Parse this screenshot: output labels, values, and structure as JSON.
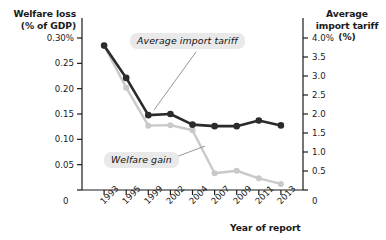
{
  "chart_data": {
    "type": "line",
    "title": "",
    "xlabel": "Year of report",
    "categories": [
      "1993",
      "1995",
      "1999",
      "2002",
      "2004",
      "2007",
      "2009",
      "2011",
      "2013"
    ],
    "grid": false,
    "legend_position": "inline-callouts",
    "axes": {
      "left": {
        "label": "Welfare loss (% of GDP)",
        "ticks": [
          "0",
          "0.05",
          "0.10",
          "0.15",
          "0.20",
          "0.25",
          "0.30%"
        ],
        "tick_values": [
          0,
          0.05,
          0.1,
          0.15,
          0.2,
          0.25,
          0.3
        ],
        "ylim": [
          0,
          0.3
        ]
      },
      "right": {
        "label": "Average import tariff (%)",
        "ticks": [
          "0",
          "0.5",
          "1.0",
          "1.5",
          "2.0",
          "2.5",
          "3.0",
          "3.5",
          "4.0%"
        ],
        "tick_values": [
          0,
          0.5,
          1.0,
          1.5,
          2.0,
          2.5,
          3.0,
          3.5,
          4.0
        ],
        "ylim": [
          0,
          4.0
        ]
      }
    },
    "series": [
      {
        "name": "Average import tariff",
        "axis": "right",
        "color": "#2b2b2b",
        "values": [
          3.8,
          2.95,
          1.97,
          2.0,
          1.72,
          1.68,
          1.68,
          1.83,
          1.7
        ]
      },
      {
        "name": "Welfare gain",
        "axis": "left",
        "color": "#c9c9c9",
        "values": [
          0.285,
          0.202,
          0.127,
          0.128,
          0.118,
          0.033,
          0.038,
          0.023,
          0.012
        ]
      }
    ],
    "annotations": [
      {
        "text": "Average import tariff",
        "target_series": "Average import tariff"
      },
      {
        "text": "Welfare gain",
        "target_series": "Welfare gain"
      }
    ],
    "corner_labels": {
      "left_zero": "0",
      "right_zero": "0"
    }
  }
}
